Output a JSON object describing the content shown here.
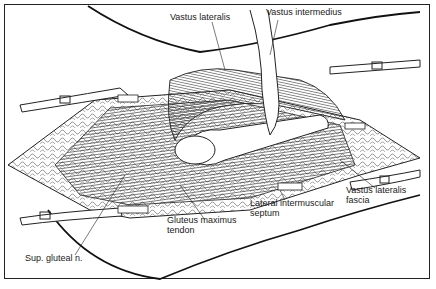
{
  "figure": {
    "type": "anatomical line illustration",
    "labels": [
      {
        "id": "vastus-lateralis",
        "text": "Vastus lateralis"
      },
      {
        "id": "vastus-intermedius",
        "text": "Vastus intermedius"
      },
      {
        "id": "vastus-lateralis-fascia",
        "text": "Vastus lateralis\nfascia"
      },
      {
        "id": "lateral-intermuscular-septum",
        "text": "Lateral intermuscular\nseptum"
      },
      {
        "id": "gluteus-maximus-tendon",
        "text": "Gluteus maximus\ntendon"
      },
      {
        "id": "sup-gluteal-n",
        "text": "Sup. gluteal n."
      }
    ],
    "colors": {
      "ink": "#1a1a1a",
      "background": "#ffffff"
    }
  }
}
